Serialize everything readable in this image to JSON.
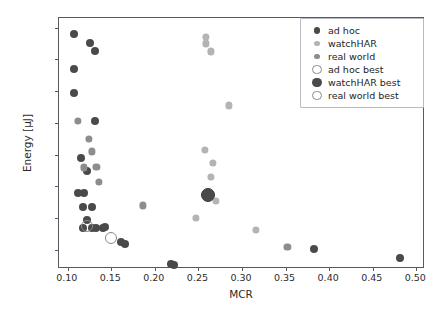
{
  "chart_data": {
    "type": "scatter",
    "title": "",
    "xlabel": "MCR",
    "ylabel": "Energy [µJ]",
    "xlim": [
      0.09,
      0.51
    ],
    "ylim": [
      1400,
      9300
    ],
    "grid": false,
    "legend_position": "upper right",
    "xticks": [
      "0.10",
      "0.15",
      "0.20",
      "0.25",
      "0.30",
      "0.35",
      "0.40",
      "0.45",
      "0.50"
    ],
    "xtick_values": [
      0.1,
      0.15,
      0.2,
      0.25,
      0.3,
      0.35,
      0.4,
      0.45,
      0.5
    ],
    "yticks": [
      "2000",
      "3000",
      "4000",
      "5000",
      "6000",
      "7000",
      "8000",
      "9000"
    ],
    "ytick_values": [
      2000,
      3000,
      4000,
      5000,
      6000,
      7000,
      8000,
      9000
    ],
    "series": [
      {
        "name": "ad hoc",
        "color": "#4a4a4a",
        "marker": "filled-circle",
        "size": 4,
        "points": [
          [
            0.107,
            8800
          ],
          [
            0.107,
            7700
          ],
          [
            0.126,
            8500
          ],
          [
            0.131,
            8250
          ],
          [
            0.107,
            6950
          ],
          [
            0.131,
            6050
          ],
          [
            0.115,
            4900
          ],
          [
            0.122,
            4500
          ],
          [
            0.112,
            3800
          ],
          [
            0.119,
            3800
          ],
          [
            0.117,
            3350
          ],
          [
            0.128,
            3350
          ],
          [
            0.122,
            2950
          ],
          [
            0.128,
            2700
          ],
          [
            0.132,
            2700
          ],
          [
            0.141,
            2700
          ],
          [
            0.143,
            2730
          ],
          [
            0.118,
            2700
          ],
          [
            0.161,
            2250
          ],
          [
            0.166,
            2180
          ],
          [
            0.219,
            1560
          ],
          [
            0.222,
            1520
          ],
          [
            0.383,
            2030
          ],
          [
            0.481,
            1750
          ]
        ]
      },
      {
        "name": "watchHAR",
        "color": "#b4b4b4",
        "marker": "filled-circle",
        "size": 3.6,
        "points": [
          [
            0.259,
            8700
          ],
          [
            0.259,
            8500
          ],
          [
            0.264,
            8250
          ],
          [
            0.285,
            6550
          ],
          [
            0.257,
            5150
          ],
          [
            0.267,
            4750
          ],
          [
            0.264,
            4300
          ],
          [
            0.27,
            3550
          ],
          [
            0.247,
            3000
          ],
          [
            0.316,
            2620
          ]
        ]
      },
      {
        "name": "real world",
        "color": "#8d8d8d",
        "marker": "filled-circle",
        "size": 3.6,
        "points": [
          [
            0.112,
            6050
          ],
          [
            0.124,
            5500
          ],
          [
            0.128,
            5100
          ],
          [
            0.133,
            4620
          ],
          [
            0.119,
            4600
          ],
          [
            0.136,
            4150
          ],
          [
            0.186,
            3400
          ],
          [
            0.352,
            2100
          ]
        ]
      },
      {
        "name": "ad hoc best",
        "color": "#8a8a8a",
        "marker": "open-circle",
        "size": 5,
        "points": [
          [
            0.122,
            2740
          ]
        ]
      },
      {
        "name": "watchHAR best",
        "color": "#4a4a4a",
        "marker": "filled-circle-large",
        "size": 6,
        "points": [
          [
            0.261,
            3720
          ]
        ]
      },
      {
        "name": "real world best",
        "color": "#8a8a8a",
        "marker": "open-circle",
        "size": 5,
        "points": [
          [
            0.15,
            2380
          ]
        ]
      }
    ]
  },
  "legend": {
    "entries": [
      {
        "label": "ad hoc",
        "marker": "filled-circle",
        "color": "#4a4a4a",
        "size": 4
      },
      {
        "label": "watchHAR",
        "marker": "filled-circle",
        "color": "#b4b4b4",
        "size": 3.6
      },
      {
        "label": "real world",
        "marker": "filled-circle",
        "color": "#8d8d8d",
        "size": 3.6
      },
      {
        "label": "ad hoc best",
        "marker": "open-circle",
        "color": "#8a8a8a",
        "size": 5
      },
      {
        "label": "watchHAR best",
        "marker": "filled-circle-large",
        "color": "#4a4a4a",
        "size": 6
      },
      {
        "label": "real world best",
        "marker": "open-circle",
        "color": "#8a8a8a",
        "size": 5
      }
    ]
  }
}
